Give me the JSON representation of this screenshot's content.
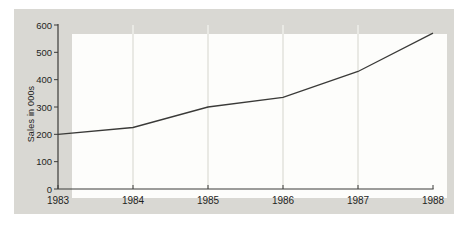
{
  "chart_data": {
    "type": "line",
    "x": [
      1983,
      1984,
      1985,
      1986,
      1987,
      1988
    ],
    "values": [
      200,
      225,
      300,
      335,
      430,
      570
    ],
    "title": "",
    "xlabel": "",
    "ylabel": "Sales in 000s",
    "ylim": [
      0,
      600
    ],
    "yticks": [
      0,
      100,
      200,
      300,
      400,
      500,
      600
    ],
    "xticks": [
      "1983",
      "1984",
      "1985",
      "1986",
      "1987",
      "1988"
    ],
    "grid": "vertical-only",
    "gridline_years": [
      1984,
      1985,
      1986,
      1987
    ],
    "legend": "none",
    "colors": {
      "panel_bg": "#d9d8d3",
      "plot_bg": "#fdfdfb",
      "gridline": "#e9e9e4",
      "axis": "#3c3c3a",
      "line": "#3a3a38",
      "text": "#1f1f1d"
    }
  }
}
